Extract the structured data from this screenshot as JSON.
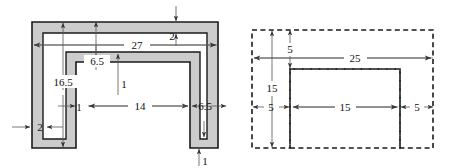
{
  "figure": {
    "colors": {
      "fill": "#cccccc",
      "outline": "#1a1a1a",
      "dimension_line": "#555555",
      "dashed_outline": "#1a1a1a",
      "text": "#111111",
      "background": "#ffffff"
    }
  },
  "left_figure": {
    "name": "shaded-channel-section",
    "style": "solid-filled",
    "dimensions": [
      {
        "id": "top-flange-thickness",
        "label": "2",
        "orientation": "vertical",
        "x": 172,
        "y": 34
      },
      {
        "id": "overall-width",
        "label": "27",
        "orientation": "horizontal",
        "x": 137,
        "y": 49
      },
      {
        "id": "left-web-offset",
        "label": "6.5",
        "orientation": "vertical",
        "x": 97,
        "y": 62
      },
      {
        "id": "overall-height",
        "label": "16.5",
        "orientation": "vertical",
        "x": 63,
        "y": 82
      },
      {
        "id": "inner-top-thickness",
        "label": "1",
        "orientation": "vertical",
        "x": 123,
        "y": 86
      },
      {
        "id": "left-wall-thickness",
        "label": "1",
        "orientation": "horizontal",
        "x": 78,
        "y": 110
      },
      {
        "id": "inner-span",
        "label": "14",
        "orientation": "horizontal",
        "x": 140,
        "y": 110
      },
      {
        "id": "right-flange-width",
        "label": "6.5",
        "orientation": "horizontal",
        "x": 205,
        "y": 110
      },
      {
        "id": "left-edge-thickness",
        "label": "2",
        "orientation": "horizontal",
        "x": 40,
        "y": 131
      },
      {
        "id": "bottom-thickness",
        "label": "1",
        "orientation": "vertical",
        "x": 204,
        "y": 161
      }
    ]
  },
  "right_figure": {
    "name": "dashed-centroid-decomposition",
    "style": "dashed-outline",
    "dimensions": [
      {
        "id": "top-strip-height",
        "label": "5",
        "orientation": "vertical",
        "x": 290,
        "y": 50
      },
      {
        "id": "overall-width",
        "label": "25",
        "orientation": "horizontal",
        "x": 355,
        "y": 58
      },
      {
        "id": "overall-height",
        "label": "15",
        "orientation": "vertical",
        "x": 272,
        "y": 88
      },
      {
        "id": "left-leg-width",
        "label": "5",
        "orientation": "horizontal",
        "x": 271,
        "y": 111
      },
      {
        "id": "middle-span",
        "label": "15",
        "orientation": "horizontal",
        "x": 345,
        "y": 111
      },
      {
        "id": "right-leg-width",
        "label": "5",
        "orientation": "horizontal",
        "x": 417,
        "y": 111
      }
    ]
  }
}
